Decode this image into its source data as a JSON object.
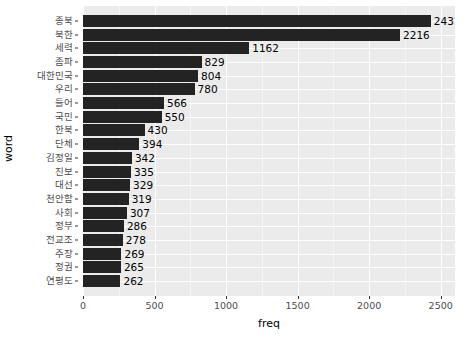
{
  "chart_data": {
    "type": "bar",
    "orientation": "horizontal",
    "title": "",
    "xlabel": "freq",
    "ylabel": "word",
    "xlim": [
      0,
      2600
    ],
    "xticks": [
      0,
      500,
      1000,
      1500,
      2000,
      2500
    ],
    "xtick_labels": [
      "0",
      "500",
      "1000",
      "1500",
      "2000",
      "2500"
    ],
    "grid": true,
    "legend": "none",
    "bar_color": "#232323",
    "panel_color": "#ebebeb",
    "gridline_color": "#ffffff",
    "categories": [
      "종북",
      "북한",
      "세력",
      "좀파",
      "대한민국",
      "우리",
      "들어",
      "국민",
      "한북",
      "단체",
      "김정일",
      "진보",
      "대선",
      "천안함",
      "사회",
      "정부",
      "전교조",
      "주장",
      "정권",
      "연평도"
    ],
    "values": [
      2431,
      2216,
      1162,
      829,
      804,
      780,
      566,
      550,
      430,
      394,
      342,
      335,
      329,
      319,
      307,
      286,
      278,
      269,
      265,
      262
    ],
    "value_labels": [
      "2431",
      "2216",
      "1162",
      "829",
      "804",
      "780",
      "566",
      "550",
      "430",
      "394",
      "342",
      "335",
      "329",
      "319",
      "307",
      "286",
      "278",
      "269",
      "265",
      "262"
    ]
  }
}
